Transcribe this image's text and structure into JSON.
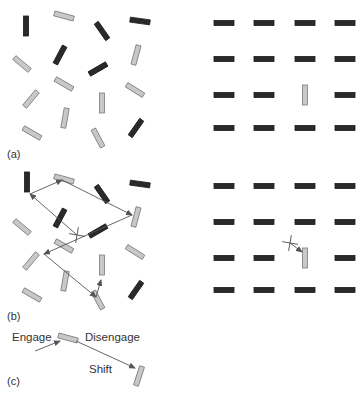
{
  "colors": {
    "dark_bar": "#2a2a2a",
    "light_bar_fill": "#c8c8c8",
    "light_bar_stroke": "#7a7a7a",
    "arrow": "#555555",
    "text": "#333333"
  },
  "panels": {
    "a": {
      "label": "(a)"
    },
    "b": {
      "label": "(b)"
    },
    "c": {
      "label": "(c)"
    }
  },
  "stages": {
    "engage": "Engage",
    "disengage": "Disengage",
    "shift": "Shift"
  },
  "panel_a_left_bars": [
    {
      "x": 26,
      "y": 26,
      "angle": 90,
      "type": "dark"
    },
    {
      "x": 64,
      "y": 16,
      "angle": 15,
      "type": "light"
    },
    {
      "x": 102,
      "y": 31,
      "angle": 55,
      "type": "dark"
    },
    {
      "x": 140,
      "y": 21,
      "angle": 8,
      "type": "dark"
    },
    {
      "x": 22,
      "y": 64,
      "angle": 40,
      "type": "light"
    },
    {
      "x": 60,
      "y": 55,
      "angle": -62,
      "type": "dark"
    },
    {
      "x": 98,
      "y": 69,
      "angle": -30,
      "type": "dark"
    },
    {
      "x": 136,
      "y": 55,
      "angle": -75,
      "type": "light"
    },
    {
      "x": 64,
      "y": 84,
      "angle": 30,
      "type": "light"
    },
    {
      "x": 31,
      "y": 99,
      "angle": -50,
      "type": "light"
    },
    {
      "x": 102,
      "y": 103,
      "angle": 90,
      "type": "light"
    },
    {
      "x": 135,
      "y": 90,
      "angle": 32,
      "type": "light"
    },
    {
      "x": 32,
      "y": 133,
      "angle": 30,
      "type": "light"
    },
    {
      "x": 65,
      "y": 118,
      "angle": -80,
      "type": "light"
    },
    {
      "x": 98,
      "y": 138,
      "angle": 62,
      "type": "light"
    },
    {
      "x": 136,
      "y": 128,
      "angle": -55,
      "type": "dark"
    }
  ],
  "panel_a_right_grid": {
    "columns": [
      224,
      264,
      305,
      345
    ],
    "rows": [
      23,
      59,
      95,
      128
    ],
    "target": {
      "col": 2,
      "row": 2
    }
  },
  "panel_b_left_bars": [
    {
      "x": 27,
      "y": 182,
      "angle": 90,
      "type": "dark"
    },
    {
      "x": 64,
      "y": 179,
      "angle": 15,
      "type": "light"
    },
    {
      "x": 102,
      "y": 194,
      "angle": 55,
      "type": "dark"
    },
    {
      "x": 140,
      "y": 184,
      "angle": 8,
      "type": "dark"
    },
    {
      "x": 22,
      "y": 227,
      "angle": 40,
      "type": "light"
    },
    {
      "x": 60,
      "y": 218,
      "angle": -62,
      "type": "dark"
    },
    {
      "x": 98,
      "y": 231,
      "angle": -30,
      "type": "dark"
    },
    {
      "x": 136,
      "y": 217,
      "angle": -75,
      "type": "light"
    },
    {
      "x": 64,
      "y": 246,
      "angle": 30,
      "type": "light"
    },
    {
      "x": 31,
      "y": 261,
      "angle": -50,
      "type": "light"
    },
    {
      "x": 102,
      "y": 265,
      "angle": 90,
      "type": "light"
    },
    {
      "x": 135,
      "y": 252,
      "angle": 32,
      "type": "light"
    },
    {
      "x": 32,
      "y": 295,
      "angle": 30,
      "type": "light"
    },
    {
      "x": 65,
      "y": 281,
      "angle": -80,
      "type": "light"
    },
    {
      "x": 98,
      "y": 300,
      "angle": 62,
      "type": "light"
    },
    {
      "x": 136,
      "y": 290,
      "angle": -55,
      "type": "dark"
    }
  ],
  "panel_b_scanpath": [
    {
      "x": 77,
      "y": 235
    },
    {
      "x": 30,
      "y": 194
    },
    {
      "x": 62,
      "y": 180
    },
    {
      "x": 132,
      "y": 215
    },
    {
      "x": 44,
      "y": 254
    },
    {
      "x": 96,
      "y": 297
    },
    {
      "x": 101,
      "y": 280
    }
  ],
  "panel_b_cross": {
    "x": 77,
    "y": 235
  },
  "panel_b_right_grid": {
    "columns": [
      224,
      264,
      305,
      345
    ],
    "rows": [
      186,
      222,
      258,
      290
    ],
    "target": {
      "col": 2,
      "row": 2
    }
  },
  "panel_b_right_cross": {
    "x": 290,
    "y": 243
  },
  "panel_c": {
    "bar1": {
      "x": 68,
      "y": 338,
      "angle": 15,
      "type": "light"
    },
    "bar2": {
      "x": 139,
      "y": 376,
      "angle": -72,
      "type": "light"
    }
  }
}
